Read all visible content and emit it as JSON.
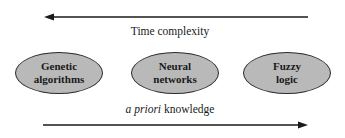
{
  "diagram": {
    "top_arrow": {
      "direction": "left",
      "label": "Time complexity"
    },
    "nodes": [
      {
        "line1": "Genetic",
        "line2": "algorithms"
      },
      {
        "line1": "Neural",
        "line2": "networks"
      },
      {
        "line1": "Fuzzy",
        "line2": "logic"
      }
    ],
    "bottom_arrow": {
      "direction": "right",
      "label_italic": "a priori",
      "label_rest": " knowledge"
    },
    "colors": {
      "node_fill": "#b9b9b9",
      "node_border": "#2a2a2a",
      "arrow": "#1a1a1a",
      "background": "#ffffff"
    }
  }
}
